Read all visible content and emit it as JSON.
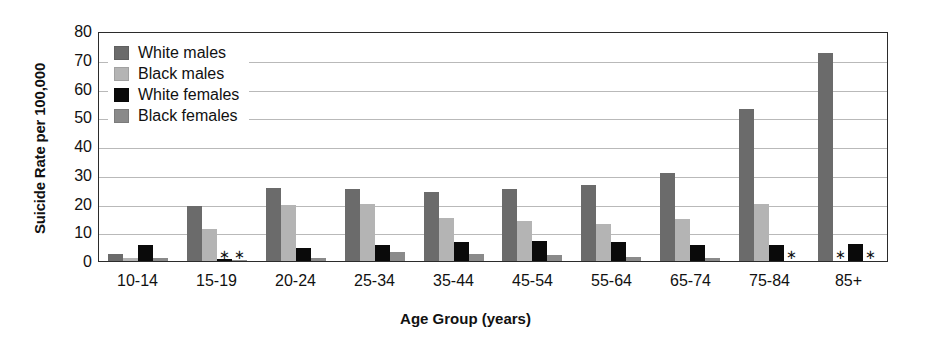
{
  "chart_data": {
    "type": "bar",
    "title": "",
    "xlabel": "Age Group (years)",
    "ylabel": "Suicide Rate per 100,000",
    "ylim": [
      0,
      80
    ],
    "ytick_step": 10,
    "yticks": [
      "80",
      "70",
      "60",
      "50",
      "40",
      "30",
      "20",
      "10",
      "0"
    ],
    "grid": true,
    "legend_position": "top-left",
    "categories": [
      "10-14",
      "15-19",
      "20-24",
      "25-34",
      "35-44",
      "45-54",
      "55-64",
      "65-74",
      "75-84",
      "85+"
    ],
    "series": [
      {
        "name": "White males",
        "color": "#6b6b6b",
        "values": [
          2.3,
          19.0,
          25.5,
          25.0,
          24.0,
          25.0,
          26.5,
          30.5,
          53.0,
          72.5
        ],
        "suppressed": [
          false,
          false,
          false,
          false,
          false,
          false,
          false,
          false,
          false,
          false
        ]
      },
      {
        "name": "Black males",
        "color": "#b4b4b4",
        "values": [
          1.0,
          11.0,
          19.5,
          20.0,
          15.0,
          14.0,
          13.0,
          14.5,
          20.0,
          null
        ],
        "suppressed": [
          false,
          false,
          false,
          false,
          false,
          false,
          false,
          false,
          false,
          true
        ]
      },
      {
        "name": "White females",
        "color": "#0a0a0a",
        "values": [
          5.5,
          0.6,
          4.5,
          5.5,
          6.5,
          7.0,
          6.5,
          5.5,
          5.5,
          6.0
        ],
        "suppressed": [
          false,
          true,
          false,
          false,
          false,
          false,
          false,
          false,
          false,
          false
        ]
      },
      {
        "name": "Black females",
        "color": "#8a8a8a",
        "values": [
          1.2,
          0.4,
          1.0,
          3.0,
          2.5,
          2.0,
          1.5,
          1.0,
          null,
          null
        ],
        "suppressed": [
          false,
          true,
          false,
          false,
          false,
          false,
          false,
          false,
          true,
          true
        ]
      }
    ],
    "suppressed_marker": "∗"
  },
  "legend": {
    "items": [
      {
        "label": "White males",
        "swatch": "white-males"
      },
      {
        "label": "Black males",
        "swatch": "black-males"
      },
      {
        "label": "White females",
        "swatch": "white-females"
      },
      {
        "label": "Black females",
        "swatch": "black-females"
      }
    ]
  },
  "axes": {
    "y_title": "Suicide Rate per 100,000",
    "x_title": "Age Group (years)"
  }
}
